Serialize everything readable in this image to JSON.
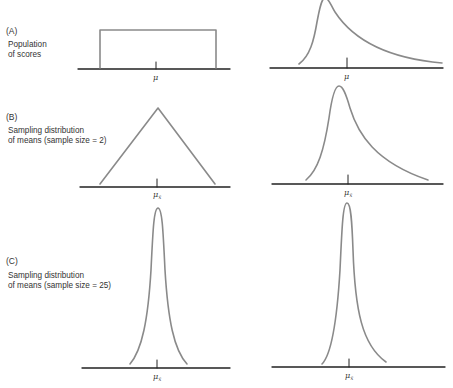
{
  "panels": [
    {
      "id": "A",
      "letter": "(A)",
      "description_line1": "Population",
      "description_line2": "of scores",
      "left_axis_label": "μ",
      "right_axis_label": "μ",
      "left_shape": "uniform (rectangle)",
      "right_shape": "positively skewed"
    },
    {
      "id": "B",
      "letter": "(B)",
      "description_line1": "Sampling distribution",
      "description_line2": "of means (sample size = 2)",
      "left_axis_label": "μ",
      "left_axis_sub": "x̄",
      "right_axis_label": "μ",
      "right_axis_sub": "x̄",
      "left_shape": "triangular",
      "right_shape": "moderately skewed"
    },
    {
      "id": "C",
      "letter": "(C)",
      "description_line1": "Sampling distribution",
      "description_line2": "of means (sample size = 25)",
      "left_axis_label": "μ",
      "left_axis_sub": "x̄",
      "right_axis_label": "μ",
      "right_axis_sub": "x̄",
      "left_shape": "narrow normal",
      "right_shape": "narrow near-normal"
    }
  ],
  "colors": {
    "curve": "#8a8a8a",
    "axis": "#222222",
    "text": "#333333"
  }
}
